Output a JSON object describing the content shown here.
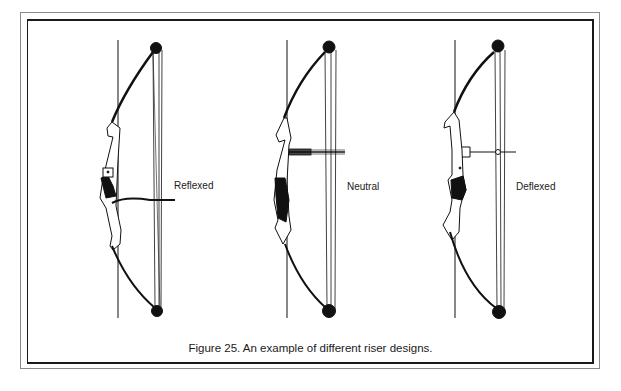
{
  "figure": {
    "caption": "Figure 25.  An example of different riser designs.",
    "bows": [
      {
        "label": "Reflexed"
      },
      {
        "label": "Neutral"
      },
      {
        "label": "Deflexed"
      }
    ]
  }
}
